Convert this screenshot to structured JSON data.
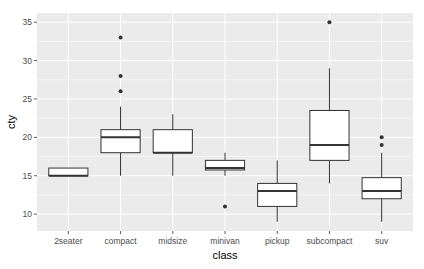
{
  "chart_data": {
    "type": "boxplot",
    "title": "",
    "xlabel": "class",
    "ylabel": "cty",
    "ylim": [
      7.8,
      36.2
    ],
    "yticks": [
      10,
      15,
      20,
      25,
      30,
      35
    ],
    "grid": true,
    "legend": null,
    "categories": [
      "2seater",
      "compact",
      "midsize",
      "minivan",
      "pickup",
      "subcompact",
      "suv"
    ],
    "boxes": [
      {
        "category": "2seater",
        "whisker_low": 15,
        "q1": 15,
        "median": 15,
        "q3": 16,
        "whisker_high": 16,
        "outliers": []
      },
      {
        "category": "compact",
        "whisker_low": 15,
        "q1": 18,
        "median": 20,
        "q3": 21,
        "whisker_high": 24,
        "outliers": [
          26,
          28,
          33
        ]
      },
      {
        "category": "midsize",
        "whisker_low": 15,
        "q1": 18,
        "median": 18,
        "q3": 21,
        "whisker_high": 23,
        "outliers": []
      },
      {
        "category": "minivan",
        "whisker_low": 15,
        "q1": 15.75,
        "median": 16,
        "q3": 17,
        "whisker_high": 18,
        "outliers": [
          11
        ]
      },
      {
        "category": "pickup",
        "whisker_low": 9,
        "q1": 11,
        "median": 13,
        "q3": 14,
        "whisker_high": 17,
        "outliers": []
      },
      {
        "category": "subcompact",
        "whisker_low": 14,
        "q1": 17,
        "median": 19,
        "q3": 23.5,
        "whisker_high": 29,
        "outliers": [
          35
        ]
      },
      {
        "category": "suv",
        "whisker_low": 9,
        "q1": 12,
        "median": 13,
        "q3": 14.75,
        "whisker_high": 18,
        "outliers": [
          19,
          20
        ]
      }
    ]
  },
  "style": {
    "panel_bg": "#ebebeb",
    "grid_major": "#ffffff",
    "box_stroke": "#333333",
    "box_fill": "#ffffff",
    "outlier": "#333333"
  }
}
